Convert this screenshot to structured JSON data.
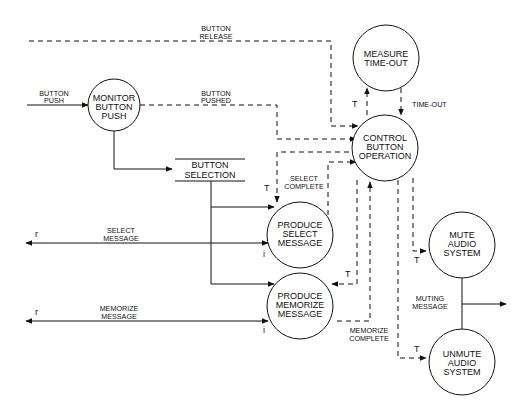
{
  "diagram": {
    "type": "data-flow / control-flow diagram",
    "processes": [
      {
        "id": "monitor",
        "lines": [
          "MONITOR",
          "BUTTON",
          "PUSH"
        ]
      },
      {
        "id": "measure",
        "lines": [
          "MEASURE",
          "TIME-OUT"
        ]
      },
      {
        "id": "control",
        "lines": [
          "CONTROL",
          "BUTTON",
          "OPERATION"
        ]
      },
      {
        "id": "select",
        "lines": [
          "PRODUCE",
          "SELECT",
          "MESSAGE"
        ]
      },
      {
        "id": "memorize",
        "lines": [
          "PRODUCE",
          "MEMORIZE",
          "MESSAGE"
        ]
      },
      {
        "id": "mute",
        "lines": [
          "MUTE",
          "AUDIO",
          "SYSTEM"
        ]
      },
      {
        "id": "unmute",
        "lines": [
          "UNMUTE",
          "AUDIO",
          "SYSTEM"
        ]
      }
    ],
    "store": {
      "id": "button-selection",
      "lines": [
        "BUTTON",
        "SELECTION"
      ]
    },
    "flows": {
      "button_push": [
        "BUTTON",
        "PUSH"
      ],
      "button_release": [
        "BUTTON",
        "RELEASE"
      ],
      "button_pushed": [
        "BUTTON",
        "PUSHED"
      ],
      "select_complete": [
        "SELECT",
        "COMPLETE"
      ],
      "memorize_complete": [
        "MEMORIZE",
        "COMPLETE"
      ],
      "time_out": "TIME-OUT",
      "select_message": [
        "SELECT",
        "MESSAGE"
      ],
      "memorize_message": [
        "MEMORIZE",
        "MESSAGE"
      ],
      "muting_message": [
        "MUTING",
        "MESSAGE"
      ]
    },
    "flags": {
      "trigger": "T",
      "input": "i",
      "return": "r"
    }
  }
}
